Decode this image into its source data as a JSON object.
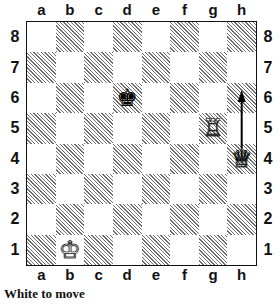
{
  "board": {
    "files": [
      "a",
      "b",
      "c",
      "d",
      "e",
      "f",
      "g",
      "h"
    ],
    "ranks": [
      "8",
      "7",
      "6",
      "5",
      "4",
      "3",
      "2",
      "1"
    ],
    "pieces": [
      {
        "square": "d6",
        "piece": "king",
        "color": "black",
        "glyph": "♚"
      },
      {
        "square": "g5",
        "piece": "rook",
        "color": "white",
        "glyph": "♖"
      },
      {
        "square": "h4",
        "piece": "queen",
        "color": "white",
        "glyph": "♕"
      },
      {
        "square": "b1",
        "piece": "king",
        "color": "white",
        "glyph": "♔"
      }
    ],
    "arrow": {
      "from": "h4",
      "to": "h6"
    }
  },
  "caption": "White to move",
  "colors": {
    "dark_square_hatch": "#6e6e6e",
    "light_square": "#ffffff",
    "border": "#111111"
  }
}
